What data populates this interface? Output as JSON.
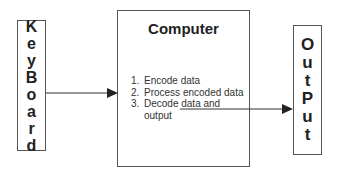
{
  "keyboard": {
    "letters": [
      "K",
      "e",
      "y",
      "B",
      "o",
      "a",
      "r",
      "d"
    ]
  },
  "computer": {
    "title": "Computer",
    "steps": [
      "Encode data",
      "Process encoded data",
      "Decode data and output"
    ]
  },
  "output": {
    "letters": [
      "O",
      "u",
      "t",
      "P",
      "u",
      "t"
    ]
  },
  "colors": {
    "line": "#333333",
    "border": "#555555",
    "text": "#222222"
  }
}
